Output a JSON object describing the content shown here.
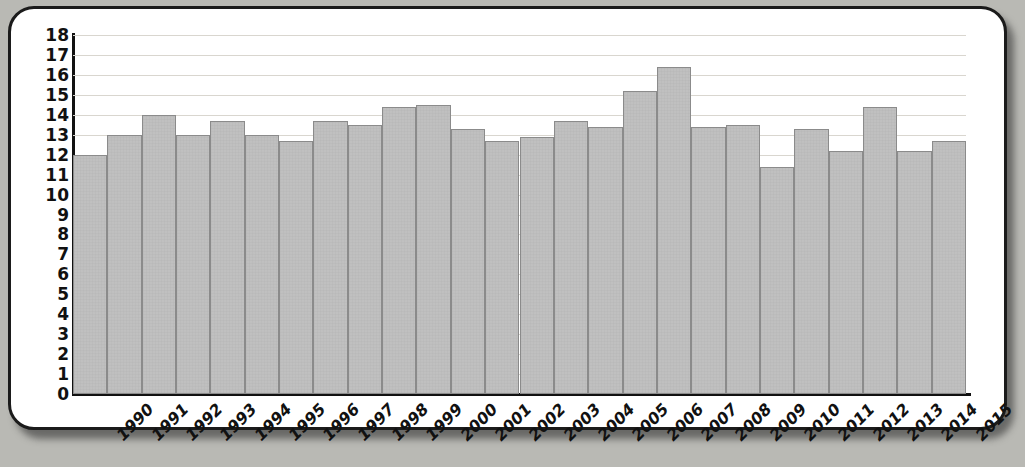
{
  "chart_data": {
    "type": "bar",
    "title": "",
    "subtitle": "",
    "xlabel": "",
    "ylabel": "",
    "categories": [
      "1990",
      "1991",
      "1992",
      "1993",
      "1994",
      "1995",
      "1996",
      "1997",
      "1998",
      "1999",
      "2000",
      "2001",
      "2002",
      "2003",
      "2004",
      "2005",
      "2006",
      "2007",
      "2008",
      "2009",
      "2010",
      "2011",
      "2012",
      "2013",
      "2014",
      "2015"
    ],
    "values": [
      12.0,
      13.0,
      14.0,
      13.0,
      13.7,
      13.0,
      12.7,
      13.7,
      13.5,
      14.4,
      14.5,
      13.3,
      12.7,
      12.9,
      13.7,
      13.4,
      15.2,
      16.4,
      13.4,
      13.5,
      11.4,
      13.3,
      12.2,
      14.4,
      12.2,
      12.7
    ],
    "ylim": [
      0,
      18
    ],
    "ytick_labels": [
      "18",
      "17",
      "16",
      "15",
      "14",
      "13",
      "12",
      "11",
      "10",
      "9",
      "8",
      "7",
      "6",
      "5",
      "4",
      "3",
      "2",
      "1",
      "0"
    ],
    "ytick_values": [
      18,
      17,
      16,
      15,
      14,
      13,
      12,
      11,
      10,
      9,
      8,
      7,
      6,
      5,
      4,
      3,
      2,
      1,
      0
    ],
    "grid": true,
    "grid_axis": "y",
    "legend": "none",
    "series_name": "",
    "bar_color": "#c3c3c3",
    "bar_edge_color": "#8b8b8b",
    "axis_color": "#111111",
    "grid_color": "#d9d6cf",
    "background_color": "#ffffff",
    "page_background_color": "#b9b9b4",
    "xtick_rotation": -45
  }
}
